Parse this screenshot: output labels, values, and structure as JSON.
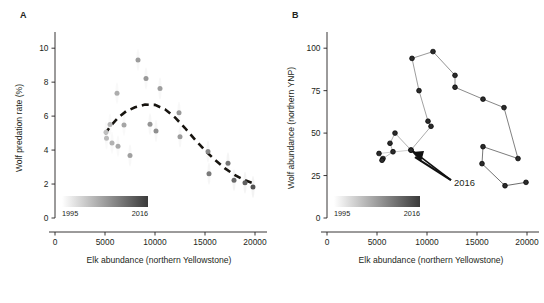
{
  "figure": {
    "panels": [
      {
        "letter": "A"
      },
      {
        "letter": "B"
      }
    ],
    "caption_partial": "clipped caption line"
  },
  "legend": {
    "start_label": "1995",
    "end_label": "2016",
    "start_color": "#ffffff",
    "end_color": "#3a3a3a"
  },
  "annotation": {
    "label_b": "2016"
  },
  "chart_data": [
    {
      "type": "scatter",
      "panel": "A",
      "title": "",
      "xlabel": "Elk abundance (northern Yellowstone)",
      "ylabel": "Wolf predation rate (%)",
      "xlim": [
        0,
        20800
      ],
      "ylim": [
        0,
        10.6
      ],
      "xticks": [
        0,
        5000,
        10000,
        15000,
        20000
      ],
      "xtick_labels": [
        "0",
        "5000",
        "10000",
        "15000",
        "20000"
      ],
      "yticks": [
        0,
        2,
        4,
        6,
        8,
        10
      ],
      "ytick_labels": [
        "0",
        "2",
        "4",
        "6",
        "8",
        "10"
      ],
      "grid": false,
      "colorbar": {
        "label_low": "1995",
        "label_high": "2016"
      },
      "points": [
        {
          "x": 5100,
          "y": 5.05,
          "year": 1995,
          "shade": 0.3
        },
        {
          "x": 5150,
          "y": 4.7,
          "year": 1996,
          "shade": 0.32
        },
        {
          "x": 5500,
          "y": 5.5,
          "year": 1997,
          "shade": 0.34
        },
        {
          "x": 5700,
          "y": 4.42,
          "year": 1998,
          "shade": 0.36
        },
        {
          "x": 6200,
          "y": 7.35,
          "year": 1999,
          "shade": 0.38
        },
        {
          "x": 6300,
          "y": 4.22,
          "year": 2000,
          "shade": 0.4
        },
        {
          "x": 6900,
          "y": 5.48,
          "year": 2001,
          "shade": 0.42
        },
        {
          "x": 7500,
          "y": 3.68,
          "year": 2002,
          "shade": 0.44
        },
        {
          "x": 8300,
          "y": 9.3,
          "year": 2003,
          "shade": 0.46
        },
        {
          "x": 9100,
          "y": 8.22,
          "year": 2004,
          "shade": 0.48
        },
        {
          "x": 9500,
          "y": 5.52,
          "year": 2005,
          "shade": 0.5
        },
        {
          "x": 10100,
          "y": 5.12,
          "year": 2006,
          "shade": 0.52
        },
        {
          "x": 10500,
          "y": 7.62,
          "year": 2007,
          "shade": 0.45
        },
        {
          "x": 12400,
          "y": 6.2,
          "year": 2008,
          "shade": 0.48
        },
        {
          "x": 12500,
          "y": 4.78,
          "year": 2009,
          "shade": 0.46
        },
        {
          "x": 15300,
          "y": 3.92,
          "year": 2010,
          "shade": 0.55
        },
        {
          "x": 15400,
          "y": 2.6,
          "year": 2011,
          "shade": 0.62
        },
        {
          "x": 17300,
          "y": 3.22,
          "year": 2012,
          "shade": 0.64
        },
        {
          "x": 17900,
          "y": 2.22,
          "year": 2013,
          "shade": 0.7
        },
        {
          "x": 19000,
          "y": 2.08,
          "year": 2014,
          "shade": 0.74
        },
        {
          "x": 19800,
          "y": 1.82,
          "year": 2015,
          "shade": 0.8
        }
      ],
      "trend_line": {
        "style": "dashed",
        "points": [
          {
            "x": 5000,
            "y": 4.95
          },
          {
            "x": 5600,
            "y": 5.45
          },
          {
            "x": 6300,
            "y": 5.9
          },
          {
            "x": 7100,
            "y": 6.28
          },
          {
            "x": 8000,
            "y": 6.52
          },
          {
            "x": 9000,
            "y": 6.68
          },
          {
            "x": 10000,
            "y": 6.66
          },
          {
            "x": 11000,
            "y": 6.4
          },
          {
            "x": 12000,
            "y": 5.92
          },
          {
            "x": 13000,
            "y": 5.3
          },
          {
            "x": 14000,
            "y": 4.62
          },
          {
            "x": 15000,
            "y": 3.98
          },
          {
            "x": 16000,
            "y": 3.42
          },
          {
            "x": 17000,
            "y": 2.92
          },
          {
            "x": 18000,
            "y": 2.52
          },
          {
            "x": 19000,
            "y": 2.22
          },
          {
            "x": 19800,
            "y": 2.05
          }
        ]
      }
    },
    {
      "type": "line",
      "panel": "B",
      "title": "",
      "xlabel": "Elk abundance (northern Yellowstone)",
      "ylabel": "Wolf abundance (northern YNP)",
      "xlim": [
        0,
        20800
      ],
      "ylim": [
        0,
        106
      ],
      "xticks": [
        0,
        5000,
        10000,
        15000,
        20000
      ],
      "xtick_labels": [
        "0",
        "5000",
        "10000",
        "15000",
        "20000"
      ],
      "yticks": [
        0,
        25,
        50,
        75,
        100
      ],
      "ytick_labels": [
        "0",
        "25",
        "50",
        "75",
        "100"
      ],
      "grid": false,
      "colorbar": {
        "label_low": "1995",
        "label_high": "2016"
      },
      "trajectory": [
        {
          "x": 19900,
          "y": 21,
          "year": 1995
        },
        {
          "x": 17800,
          "y": 19,
          "year": 1996
        },
        {
          "x": 15500,
          "y": 32,
          "year": 1997
        },
        {
          "x": 15600,
          "y": 42,
          "year": 1998
        },
        {
          "x": 19100,
          "y": 35,
          "year": 1999
        },
        {
          "x": 17700,
          "y": 65,
          "year": 2000
        },
        {
          "x": 15600,
          "y": 70,
          "year": 2001
        },
        {
          "x": 12800,
          "y": 77,
          "year": 2002
        },
        {
          "x": 12800,
          "y": 84,
          "year": 2003
        },
        {
          "x": 10600,
          "y": 98,
          "year": 2004
        },
        {
          "x": 8500,
          "y": 94,
          "year": 2005
        },
        {
          "x": 9200,
          "y": 75,
          "year": 2006
        },
        {
          "x": 10100,
          "y": 57,
          "year": 2007
        },
        {
          "x": 10400,
          "y": 54,
          "year": 2008
        },
        {
          "x": 8400,
          "y": 40,
          "year": 2009
        },
        {
          "x": 6800,
          "y": 50,
          "year": 2010
        },
        {
          "x": 6300,
          "y": 44,
          "year": 2011
        },
        {
          "x": 6600,
          "y": 39,
          "year": 2012
        },
        {
          "x": 5600,
          "y": 35,
          "year": 2013
        },
        {
          "x": 5500,
          "y": 34,
          "year": 2014
        },
        {
          "x": 5200,
          "y": 38,
          "year": 2015
        },
        {
          "x": 8400,
          "y": 40,
          "year": 2016
        }
      ],
      "annotation": {
        "text": "2016",
        "target_x": 8400,
        "target_y": 40
      }
    }
  ]
}
